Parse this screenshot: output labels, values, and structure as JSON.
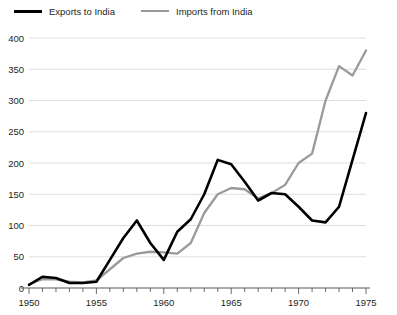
{
  "legend": {
    "entries": [
      {
        "label": "Exports to India",
        "color": "#000000",
        "key": "exports"
      },
      {
        "label": "Imports from India",
        "color": "#9a9a9a",
        "key": "imports"
      }
    ]
  },
  "chart_data": {
    "type": "line",
    "title": "",
    "subtitle": "",
    "xlabel": "",
    "ylabel": "",
    "xlim": [
      1950,
      1975
    ],
    "ylim": [
      0,
      400
    ],
    "grid": true,
    "legend_position": "top-left",
    "yticks": [
      0,
      50,
      100,
      150,
      200,
      250,
      300,
      350,
      400
    ],
    "xticks": [
      1950,
      1955,
      1960,
      1965,
      1970,
      1975
    ],
    "xtick_minor_step": 1,
    "x": [
      1950,
      1951,
      1952,
      1953,
      1954,
      1955,
      1956,
      1957,
      1958,
      1959,
      1960,
      1961,
      1962,
      1963,
      1964,
      1965,
      1966,
      1967,
      1968,
      1969,
      1970,
      1971,
      1972,
      1973,
      1974,
      1975
    ],
    "series": [
      {
        "name": "Exports to India",
        "color": "#000000",
        "values": [
          5,
          18,
          16,
          8,
          8,
          10,
          45,
          80,
          108,
          72,
          45,
          90,
          110,
          150,
          205,
          198,
          170,
          140,
          152,
          150,
          130,
          108,
          105,
          130,
          205,
          280
        ]
      },
      {
        "name": "Imports from India",
        "color": "#9a9a9a",
        "values": [
          6,
          14,
          14,
          10,
          9,
          12,
          30,
          48,
          55,
          58,
          57,
          55,
          72,
          120,
          150,
          160,
          158,
          143,
          152,
          165,
          200,
          215,
          300,
          355,
          340,
          380
        ]
      }
    ]
  }
}
